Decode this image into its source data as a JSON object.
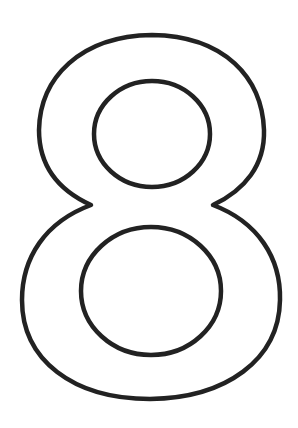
{
  "image": {
    "subject": "Outlined numeral 8",
    "glyph": "8",
    "stroke_color": "#222222",
    "fill_color": "#ffffff",
    "background": "#ffffff"
  }
}
